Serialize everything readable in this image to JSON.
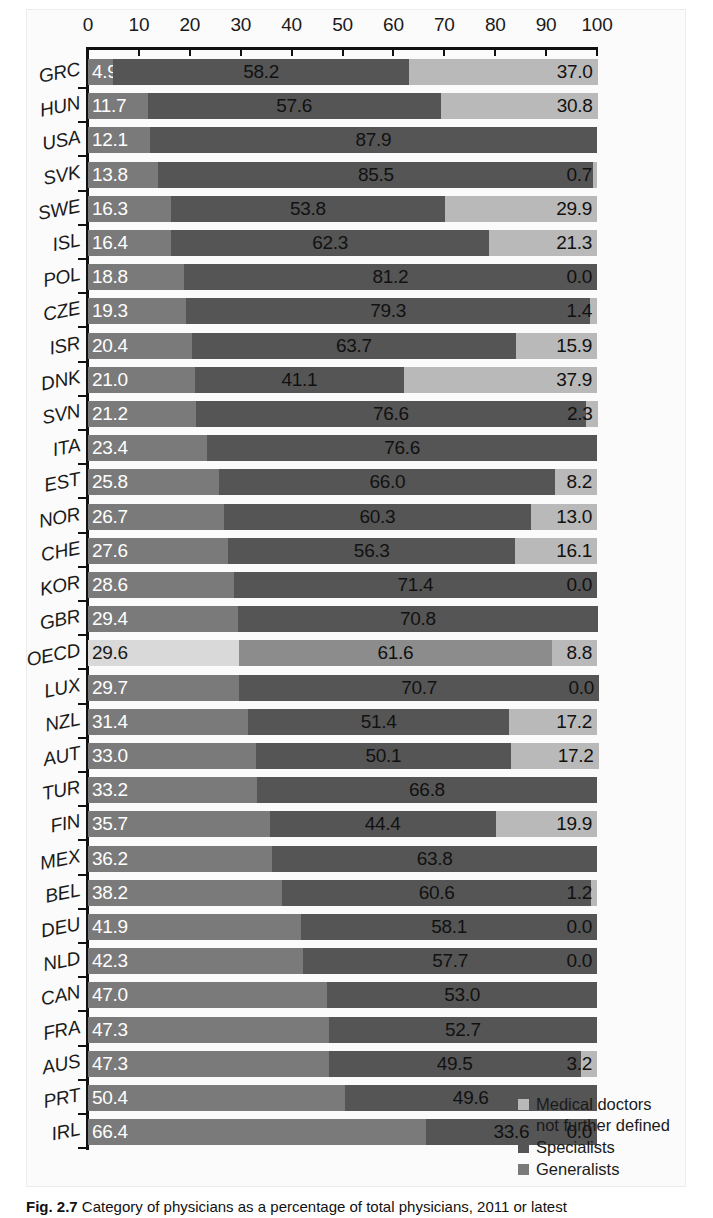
{
  "chart_data": {
    "type": "bar",
    "subtype": "stacked-horizontal-100",
    "title": "",
    "xlabel": "",
    "ylabel": "",
    "xlim": [
      0,
      100
    ],
    "grid": false,
    "legend_position": "bottom-right",
    "axis_ticks": [
      0,
      10,
      20,
      30,
      40,
      50,
      60,
      70,
      80,
      90,
      100
    ],
    "series": [
      {
        "name": "Generalists",
        "color": "#7a7a7a"
      },
      {
        "name": "Specialists",
        "color": "#555555"
      },
      {
        "name": "Medical doctors not further defined",
        "color": "#b9b9b9"
      }
    ],
    "categories": [
      "GRC",
      "HUN",
      "USA",
      "SVK",
      "SWE",
      "ISL",
      "POL",
      "CZE",
      "ISR",
      "DNK",
      "SVN",
      "ITA",
      "EST",
      "NOR",
      "CHE",
      "KOR",
      "GBR",
      "OECD",
      "LUX",
      "NZL",
      "AUT",
      "TUR",
      "FIN",
      "MEX",
      "BEL",
      "DEU",
      "NLD",
      "CAN",
      "FRA",
      "AUS",
      "PRT",
      "IRL"
    ],
    "rows": [
      {
        "country": "GRC",
        "generalists": 4.9,
        "specialists": 58.2,
        "nfd": 37.0,
        "labels": [
          "4.9",
          "58.2",
          "37.0"
        ],
        "highlight": false
      },
      {
        "country": "HUN",
        "generalists": 11.7,
        "specialists": 57.6,
        "nfd": 30.8,
        "labels": [
          "11.7",
          "57.6",
          "30.8"
        ],
        "highlight": false
      },
      {
        "country": "USA",
        "generalists": 12.1,
        "specialists": 87.9,
        "nfd": 0.0,
        "labels": [
          "12.1",
          "87.9",
          ""
        ],
        "highlight": false
      },
      {
        "country": "SVK",
        "generalists": 13.8,
        "specialists": 85.5,
        "nfd": 0.7,
        "labels": [
          "13.8",
          "85.5",
          "0.7"
        ],
        "highlight": false
      },
      {
        "country": "SWE",
        "generalists": 16.3,
        "specialists": 53.8,
        "nfd": 29.9,
        "labels": [
          "16.3",
          "53.8",
          "29.9"
        ],
        "highlight": false
      },
      {
        "country": "ISL",
        "generalists": 16.4,
        "specialists": 62.3,
        "nfd": 21.3,
        "labels": [
          "16.4",
          "62.3",
          "21.3"
        ],
        "highlight": false
      },
      {
        "country": "POL",
        "generalists": 18.8,
        "specialists": 81.2,
        "nfd": 0.0,
        "labels": [
          "18.8",
          "81.2",
          "0.0"
        ],
        "highlight": false
      },
      {
        "country": "CZE",
        "generalists": 19.3,
        "specialists": 79.3,
        "nfd": 1.4,
        "labels": [
          "19.3",
          "79.3",
          "1.4"
        ],
        "highlight": false
      },
      {
        "country": "ISR",
        "generalists": 20.4,
        "specialists": 63.7,
        "nfd": 15.9,
        "labels": [
          "20.4",
          "63.7",
          "15.9"
        ],
        "highlight": false
      },
      {
        "country": "DNK",
        "generalists": 21.0,
        "specialists": 41.1,
        "nfd": 37.9,
        "labels": [
          "21.0",
          "41.1",
          "37.9"
        ],
        "highlight": false
      },
      {
        "country": "SVN",
        "generalists": 21.2,
        "specialists": 76.6,
        "nfd": 2.3,
        "labels": [
          "21.2",
          "76.6",
          "2.3"
        ],
        "highlight": false
      },
      {
        "country": "ITA",
        "generalists": 23.4,
        "specialists": 76.6,
        "nfd": 0.0,
        "labels": [
          "23.4",
          "76.6",
          ""
        ],
        "highlight": false
      },
      {
        "country": "EST",
        "generalists": 25.8,
        "specialists": 66.0,
        "nfd": 8.2,
        "labels": [
          "25.8",
          "66.0",
          "8.2"
        ],
        "highlight": false
      },
      {
        "country": "NOR",
        "generalists": 26.7,
        "specialists": 60.3,
        "nfd": 13.0,
        "labels": [
          "26.7",
          "60.3",
          "13.0"
        ],
        "highlight": false
      },
      {
        "country": "CHE",
        "generalists": 27.6,
        "specialists": 56.3,
        "nfd": 16.1,
        "labels": [
          "27.6",
          "56.3",
          "16.1"
        ],
        "highlight": false
      },
      {
        "country": "KOR",
        "generalists": 28.6,
        "specialists": 71.4,
        "nfd": 0.0,
        "labels": [
          "28.6",
          "71.4",
          "0.0"
        ],
        "highlight": false
      },
      {
        "country": "GBR",
        "generalists": 29.4,
        "specialists": 70.8,
        "nfd": 0.0,
        "labels": [
          "29.4",
          "70.8",
          ""
        ],
        "highlight": false
      },
      {
        "country": "OECD",
        "generalists": 29.6,
        "specialists": 61.6,
        "nfd": 8.8,
        "labels": [
          "29.6",
          "61.6",
          "8.8"
        ],
        "highlight": true
      },
      {
        "country": "LUX",
        "generalists": 29.7,
        "specialists": 70.7,
        "nfd": 0.0,
        "labels": [
          "29.7",
          "70.7",
          "0.0"
        ],
        "highlight": false
      },
      {
        "country": "NZL",
        "generalists": 31.4,
        "specialists": 51.4,
        "nfd": 17.2,
        "labels": [
          "31.4",
          "51.4",
          "17.2"
        ],
        "highlight": false
      },
      {
        "country": "AUT",
        "generalists": 33.0,
        "specialists": 50.1,
        "nfd": 17.2,
        "labels": [
          "33.0",
          "50.1",
          "17.2"
        ],
        "highlight": false
      },
      {
        "country": "TUR",
        "generalists": 33.2,
        "specialists": 66.8,
        "nfd": 0.0,
        "labels": [
          "33.2",
          "66.8",
          ""
        ],
        "highlight": false
      },
      {
        "country": "FIN",
        "generalists": 35.7,
        "specialists": 44.4,
        "nfd": 19.9,
        "labels": [
          "35.7",
          "44.4",
          "19.9"
        ],
        "highlight": false
      },
      {
        "country": "MEX",
        "generalists": 36.2,
        "specialists": 63.8,
        "nfd": 0.0,
        "labels": [
          "36.2",
          "63.8",
          ""
        ],
        "highlight": false
      },
      {
        "country": "BEL",
        "generalists": 38.2,
        "specialists": 60.6,
        "nfd": 1.2,
        "labels": [
          "38.2",
          "60.6",
          "1.2"
        ],
        "highlight": false
      },
      {
        "country": "DEU",
        "generalists": 41.9,
        "specialists": 58.1,
        "nfd": 0.0,
        "labels": [
          "41.9",
          "58.1",
          "0.0"
        ],
        "highlight": false
      },
      {
        "country": "NLD",
        "generalists": 42.3,
        "specialists": 57.7,
        "nfd": 0.0,
        "labels": [
          "42.3",
          "57.7",
          "0.0"
        ],
        "highlight": false
      },
      {
        "country": "CAN",
        "generalists": 47.0,
        "specialists": 53.0,
        "nfd": 0.0,
        "labels": [
          "47.0",
          "53.0",
          ""
        ],
        "highlight": false
      },
      {
        "country": "FRA",
        "generalists": 47.3,
        "specialists": 52.7,
        "nfd": 0.0,
        "labels": [
          "47.3",
          "52.7",
          ""
        ],
        "highlight": false
      },
      {
        "country": "AUS",
        "generalists": 47.3,
        "specialists": 49.5,
        "nfd": 3.2,
        "labels": [
          "47.3",
          "49.5",
          "3.2"
        ],
        "highlight": false
      },
      {
        "country": "PRT",
        "generalists": 50.4,
        "specialists": 49.6,
        "nfd": 0.0,
        "labels": [
          "50.4",
          "49.6",
          ""
        ],
        "highlight": false
      },
      {
        "country": "IRL",
        "generalists": 66.4,
        "specialists": 33.6,
        "nfd": 0.0,
        "labels": [
          "66.4",
          "33.6",
          "0.0"
        ],
        "highlight": false
      }
    ]
  },
  "legend": {
    "items": [
      {
        "label_line1": "Medical doctors",
        "label_line2": "not further defined",
        "color": "#b9b9b9"
      },
      {
        "label_line1": "Specialists",
        "label_line2": "",
        "color": "#555555"
      },
      {
        "label_line1": "Generalists",
        "label_line2": "",
        "color": "#7a7a7a"
      }
    ]
  },
  "caption": {
    "label": "Fig. 2.7",
    "text": "Category of physicians as a percentage of total physicians, 2011 or latest"
  },
  "colors": {
    "generalists": "#7a7a7a",
    "specialists": "#555555",
    "nfd": "#b9b9b9",
    "generalists_highlight": "#d9d9d9",
    "specialists_highlight": "#8c8c8c",
    "nfd_highlight": "#b9b9b9",
    "axis": "#111111",
    "text": "#1a1a1a"
  }
}
